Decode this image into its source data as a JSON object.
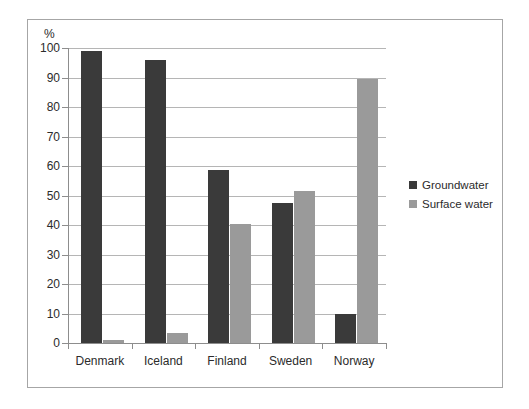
{
  "chart_data": {
    "type": "bar",
    "title": "",
    "subtitle": "",
    "xlabel": "",
    "ylabel": "%",
    "unit_label": "%",
    "ylim": [
      0,
      100
    ],
    "ytick_step": 10,
    "yticks": [
      0,
      10,
      20,
      30,
      40,
      50,
      60,
      70,
      80,
      90,
      100
    ],
    "ytick_labels": [
      "0",
      "10",
      "20",
      "30",
      "40",
      "50",
      "60",
      "70",
      "80",
      "90",
      "100"
    ],
    "grid": "horizontal",
    "legend_position": "right",
    "categories": [
      "Denmark",
      "Iceland",
      "Finland",
      "Sweden",
      "Norway"
    ],
    "series": [
      {
        "name": "Groundwater",
        "color": "#3a3a3a",
        "values": [
          99,
          96,
          58.5,
          47.5,
          10
        ]
      },
      {
        "name": "Surface water",
        "color": "#9a9a9a",
        "values": [
          1,
          3.5,
          40.5,
          51.5,
          89.5
        ]
      }
    ],
    "annotations": []
  },
  "legend": {
    "items": [
      {
        "label": "Groundwater",
        "color": "#3a3a3a"
      },
      {
        "label": "Surface water",
        "color": "#9a9a9a"
      }
    ]
  },
  "colors": {
    "groundwater": "#3a3a3a",
    "surface_water": "#9a9a9a",
    "gridline": "#b5b5b5",
    "axis": "#8d8d8d",
    "frame": "#a6a6a6",
    "text": "#2b2b2b",
    "background": "#ffffff"
  }
}
